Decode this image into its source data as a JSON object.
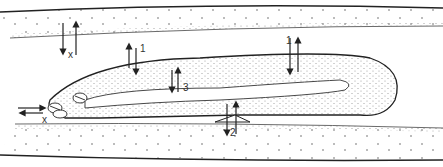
{
  "diagram": {
    "type": "anatomical-cross-section",
    "colors": {
      "line": "#222222",
      "stipple": "#777777",
      "background": "#ffffff"
    },
    "labels": [
      {
        "id": "x-top",
        "text": "x",
        "x": 68,
        "y": 54
      },
      {
        "id": "x-left",
        "text": "x",
        "x": 42,
        "y": 119
      },
      {
        "id": "one-left",
        "text": "1",
        "x": 140,
        "y": 47
      },
      {
        "id": "one-right",
        "text": "1",
        "x": 286,
        "y": 38
      },
      {
        "id": "three",
        "text": "3",
        "x": 183,
        "y": 84
      },
      {
        "id": "two",
        "text": "2",
        "x": 230,
        "y": 129
      }
    ]
  }
}
